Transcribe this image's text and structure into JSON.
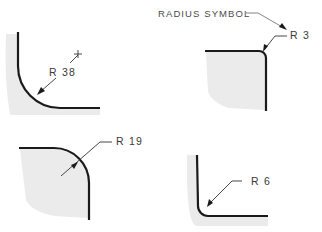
{
  "title": "RADIUS SYMBOL",
  "colors": {
    "edge": "#1a1a1a",
    "shading": "#ebebeb",
    "text": "#3a3a3a",
    "background": "#ffffff"
  },
  "examples": [
    {
      "id": "r38",
      "label": "R 38",
      "value": 38,
      "position": "top-left",
      "has_center_mark": true
    },
    {
      "id": "r3",
      "label": "R 3",
      "value": 3,
      "position": "top-right",
      "has_center_mark": false
    },
    {
      "id": "r19",
      "label": "R 19",
      "value": 19,
      "position": "bottom-left",
      "has_center_mark": false
    },
    {
      "id": "r6",
      "label": "R 6",
      "value": 6,
      "position": "bottom-right",
      "has_center_mark": false
    }
  ],
  "center_mark_icon": "plus-icon"
}
